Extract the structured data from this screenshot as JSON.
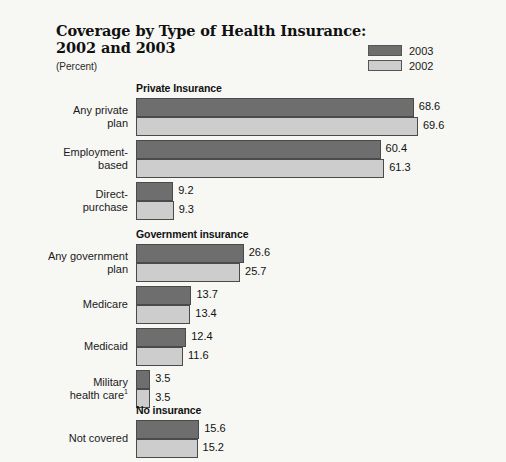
{
  "header": {
    "title": "Coverage by Type of Health Insurance:\n2002 and 2003",
    "subtitle": "(Percent)"
  },
  "legend": {
    "items": [
      {
        "label": "2003",
        "color": "#6e6e6e",
        "swatch_name": "legend-swatch-2003"
      },
      {
        "label": "2002",
        "color": "#cdcdcd",
        "swatch_name": "legend-swatch-2002"
      }
    ]
  },
  "chart_data": {
    "type": "bar",
    "orientation": "horizontal",
    "title": "Coverage by Type of Health Insurance: 2002 and 2003",
    "subtitle": "(Percent)",
    "xlabel": "",
    "ylabel": "",
    "unit": "percent",
    "xlim": [
      0,
      72
    ],
    "grid": false,
    "legend_position": "top-right",
    "series": [
      {
        "name": "2003",
        "color": "#6e6e6e"
      },
      {
        "name": "2002",
        "color": "#cdcdcd"
      }
    ],
    "sections": [
      {
        "name": "Private Insurance",
        "groups": [
          {
            "category": "Any private\nplan",
            "values": {
              "2003": 68.6,
              "2002": 69.6
            }
          },
          {
            "category": "Employment-\nbased",
            "values": {
              "2003": 60.4,
              "2002": 61.3
            }
          },
          {
            "category": "Direct-\npurchase",
            "values": {
              "2003": 9.2,
              "2002": 9.3
            }
          }
        ]
      },
      {
        "name": "Government insurance",
        "groups": [
          {
            "category": "Any government\nplan",
            "values": {
              "2003": 26.6,
              "2002": 25.7
            }
          },
          {
            "category": "Medicare",
            "values": {
              "2003": 13.7,
              "2002": 13.4
            }
          },
          {
            "category": "Medicaid",
            "values": {
              "2003": 12.4,
              "2002": 11.6
            }
          },
          {
            "category": "Military\nhealth care",
            "footnote": "1",
            "values": {
              "2003": 3.5,
              "2002": 3.5
            }
          }
        ]
      },
      {
        "name": "No insurance",
        "groups": [
          {
            "category": "Not covered",
            "values": {
              "2003": 15.6,
              "2002": 15.2
            }
          }
        ]
      }
    ]
  },
  "layout": {
    "bar_origin_x": 136,
    "px_per_unit": 4.05,
    "section_tops": [
      82,
      228,
      404
    ],
    "group_offsets": [
      [
        16,
        58,
        100
      ],
      [
        16,
        58,
        100,
        142
      ],
      [
        16
      ]
    ]
  }
}
